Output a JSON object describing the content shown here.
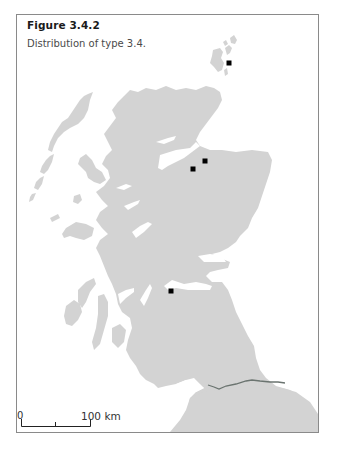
{
  "figure": {
    "title": "Figure 3.4.2",
    "caption": "Distribution of type 3.4."
  },
  "map": {
    "region": "Scotland",
    "land_color": "#d3d3d3",
    "sea_color": "#ffffff",
    "border_line_color": "#6b7470",
    "marker_color": "#000000",
    "markers": [
      {
        "id": "site-1",
        "location": "Orkney",
        "x": 229,
        "y": 63
      },
      {
        "id": "site-2",
        "location": "Moray Firth (west)",
        "x": 193,
        "y": 169
      },
      {
        "id": "site-3",
        "location": "Moray Firth (east)",
        "x": 205,
        "y": 161
      },
      {
        "id": "site-4",
        "location": "Central Belt",
        "x": 171,
        "y": 291
      }
    ]
  },
  "scale_bar": {
    "label_start": "0",
    "label_end": "100 km"
  }
}
